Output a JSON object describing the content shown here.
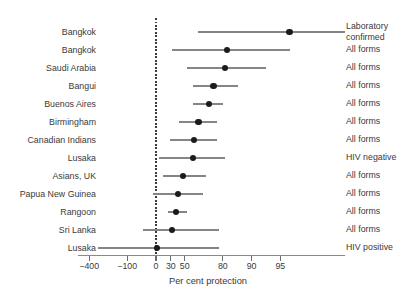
{
  "palette": {
    "background": "#ffffff",
    "text": "#3a3a3a",
    "ci_line": "#858585",
    "point_dot": "#1b1b1b",
    "axis_line": "#8a8a8a",
    "tick_mark": "#6c6c6c",
    "zero_line": "#3b3b3b"
  },
  "chart_data": {
    "type": "scatter",
    "subtype": "forest-plot",
    "title": "",
    "xlabel": "Per cent protection",
    "ylabel": "",
    "x_scale": "log relative-risk scale: position proportional to -ln(1 - protection/100)",
    "x_axis_range_percent": [
      -480,
      99
    ],
    "grid": false,
    "zero_reference_line": 0,
    "x_ticks": [
      {
        "value": -400,
        "label": "−400"
      },
      {
        "value": -100,
        "label": "−100"
      },
      {
        "value": 0,
        "label": "0"
      },
      {
        "value": 30,
        "label": "30"
      },
      {
        "value": 50,
        "label": "50"
      },
      {
        "value": 80,
        "label": "80"
      },
      {
        "value": 90,
        "label": "90"
      },
      {
        "value": 95,
        "label": "95"
      }
    ],
    "rows": [
      {
        "label": "Bangkok",
        "type": "Laboratory confirmed",
        "lower": 64,
        "point": 96,
        "upper": 99
      },
      {
        "label": "Bangkok",
        "type": "All forms",
        "lower": 32,
        "point": 82,
        "upper": 96
      },
      {
        "label": "Saudi Arabia",
        "type": "All forms",
        "lower": 53,
        "point": 81,
        "upper": 93
      },
      {
        "label": "Bangui",
        "type": "All forms",
        "lower": 59,
        "point": 75,
        "upper": 86
      },
      {
        "label": "Buenos Aires",
        "type": "All forms",
        "lower": 59,
        "point": 72,
        "upper": 80
      },
      {
        "label": "Birmingham",
        "type": "All forms",
        "lower": 43,
        "point": 64,
        "upper": 77
      },
      {
        "label": "Canadian Indians",
        "type": "All forms",
        "lower": 29,
        "point": 60,
        "upper": 77
      },
      {
        "label": "Lusaka",
        "type": "HIV negative",
        "lower": 7,
        "point": 59,
        "upper": 81
      },
      {
        "label": "Asians, UK",
        "type": "All forms",
        "lower": 16,
        "point": 48,
        "upper": 70
      },
      {
        "label": "Papua New Guinea",
        "type": "All forms",
        "lower": -7,
        "point": 41,
        "upper": 68
      },
      {
        "label": "Rangoon",
        "type": "All forms",
        "lower": 25,
        "point": 38,
        "upper": 53
      },
      {
        "label": "Sri Lanka",
        "type": "All forms",
        "lower": -37,
        "point": 32,
        "upper": 78
      },
      {
        "label": "Lusaka",
        "type": "HIV positive",
        "lower": -300,
        "point": 2,
        "upper": 78
      }
    ]
  }
}
